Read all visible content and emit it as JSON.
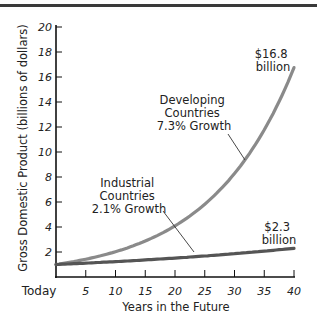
{
  "chart_data": {
    "type": "line",
    "title": "",
    "xlabel": "Years in the Future",
    "ylabel": "Gross Domestic Product (billions of dollars)",
    "x_tick_labels": [
      "Today",
      "5",
      "10",
      "15",
      "20",
      "25",
      "30",
      "35",
      "40"
    ],
    "x_ticks": [
      0,
      5,
      10,
      15,
      20,
      25,
      30,
      35,
      40
    ],
    "y_ticks": [
      2,
      4,
      6,
      8,
      10,
      12,
      14,
      16,
      18,
      20
    ],
    "xlim": [
      0,
      40
    ],
    "ylim": [
      0,
      20
    ],
    "grid": false,
    "legend": "none (inline annotations)",
    "x": [
      0,
      5,
      10,
      15,
      20,
      25,
      30,
      35,
      40
    ],
    "series": [
      {
        "name": "Developing Countries 7.3% Growth",
        "growth_rate": 0.073,
        "color": "#8a8a8a",
        "values": [
          1.0,
          1.42,
          2.02,
          2.87,
          4.09,
          5.81,
          8.27,
          11.76,
          16.8
        ]
      },
      {
        "name": "Industrial Countries 2.1% Growth",
        "growth_rate": 0.021,
        "color": "#555555",
        "values": [
          1.0,
          1.11,
          1.23,
          1.37,
          1.52,
          1.68,
          1.87,
          2.07,
          2.3
        ]
      }
    ],
    "annotations": [
      {
        "text": [
          "Developing",
          "Countries",
          "7.3% Growth"
        ],
        "points_to": "Developing Countries"
      },
      {
        "text": [
          "Industrial",
          "Countries",
          "2.1% Growth"
        ],
        "points_to": "Industrial Countries"
      },
      {
        "text": [
          "$16.8",
          "billion"
        ],
        "at": [
          40,
          16.8
        ]
      },
      {
        "text": [
          "$2.3",
          "billion"
        ],
        "at": [
          40,
          2.3
        ]
      }
    ]
  },
  "labels": {
    "ylabel": "Gross Domestic Product (billions of dollars)",
    "xlabel": "Years in the Future",
    "x_ticks": [
      "Today",
      "5",
      "10",
      "15",
      "20",
      "25",
      "30",
      "35",
      "40"
    ],
    "y_ticks": [
      "2",
      "4",
      "6",
      "8",
      "10",
      "12",
      "14",
      "16",
      "18",
      "20"
    ],
    "developing": [
      "Developing",
      "Countries",
      "7.3% Growth"
    ],
    "industrial": [
      "Industrial",
      "Countries",
      "2.1% Growth"
    ],
    "dev_end": [
      "$16.8",
      "billion"
    ],
    "ind_end": [
      "$2.3",
      "billion"
    ]
  }
}
